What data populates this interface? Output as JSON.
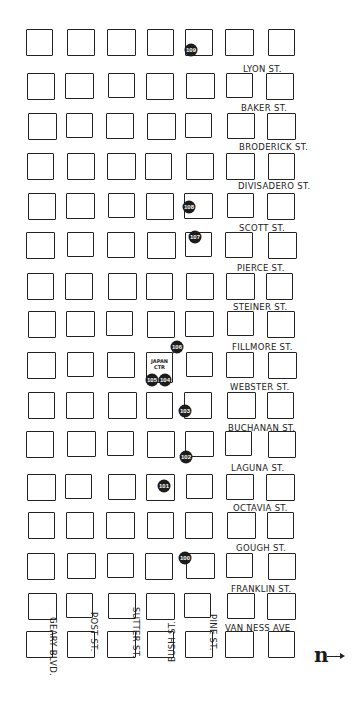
{
  "map": {
    "grid": {
      "columns_x": [
        27,
        66,
        107,
        146,
        185,
        226,
        267
      ],
      "rows_y": [
        30,
        72,
        113,
        152,
        193,
        233,
        272,
        311,
        351,
        392,
        432,
        473,
        512,
        552,
        593,
        632
      ],
      "block_size": 27
    },
    "horizontal_streets": [
      {
        "label": "LYON ST.",
        "x": 243,
        "y": 64
      },
      {
        "label": "BAKER ST.",
        "x": 241,
        "y": 103
      },
      {
        "label": "BRODERICK ST.",
        "x": 239,
        "y": 142
      },
      {
        "label": "DIVISADERO ST.",
        "x": 238,
        "y": 181
      },
      {
        "label": "SCOTT ST.",
        "x": 239,
        "y": 223
      },
      {
        "label": "PIERCE ST.",
        "x": 237,
        "y": 263
      },
      {
        "label": "STEINER ST.",
        "x": 233,
        "y": 302
      },
      {
        "label": "FILLMORE ST.",
        "x": 232,
        "y": 342
      },
      {
        "label": "WEBSTER ST.",
        "x": 230,
        "y": 382
      },
      {
        "label": "BUCHANAN ST.",
        "x": 228,
        "y": 423
      },
      {
        "label": "LAGUNA ST.",
        "x": 231,
        "y": 463
      },
      {
        "label": "OCTAVIA ST.",
        "x": 233,
        "y": 503
      },
      {
        "label": "GOUGH ST.",
        "x": 236,
        "y": 543
      },
      {
        "label": "FRANKLIN ST.",
        "x": 231,
        "y": 584
      },
      {
        "label": "VAN NESS AVE",
        "x": 225,
        "y": 623
      }
    ],
    "vertical_streets": [
      {
        "label": "GEARY BLVD.",
        "x": 58,
        "y": 617,
        "direction": "down"
      },
      {
        "label": "POST ST.",
        "x": 99,
        "y": 612,
        "direction": "down"
      },
      {
        "label": "SUTTER ST.",
        "x": 141,
        "y": 607,
        "direction": "down"
      },
      {
        "label": "BUSH ST.",
        "x": 167,
        "y": 662,
        "direction": "up"
      },
      {
        "label": "PINE ST.",
        "x": 218,
        "y": 614,
        "direction": "down"
      }
    ],
    "markers": [
      {
        "id": "100",
        "x": 185,
        "y": 558
      },
      {
        "id": "101",
        "x": 164,
        "y": 486
      },
      {
        "id": "102",
        "x": 186,
        "y": 457
      },
      {
        "id": "103",
        "x": 185,
        "y": 411
      },
      {
        "id": "104",
        "x": 165,
        "y": 380
      },
      {
        "id": "105",
        "x": 152,
        "y": 380
      },
      {
        "id": "106",
        "x": 177,
        "y": 347
      },
      {
        "id": "107",
        "x": 195,
        "y": 237
      },
      {
        "id": "108",
        "x": 189,
        "y": 207
      },
      {
        "id": "109",
        "x": 191,
        "y": 50
      }
    ],
    "special_block": {
      "label_line1": "JAPAN",
      "label_line2": "CTR",
      "x": 146,
      "y": 352,
      "w": 27,
      "h": 31
    },
    "north_indicator": {
      "symbol": "n",
      "x": 314,
      "y": 645
    }
  }
}
